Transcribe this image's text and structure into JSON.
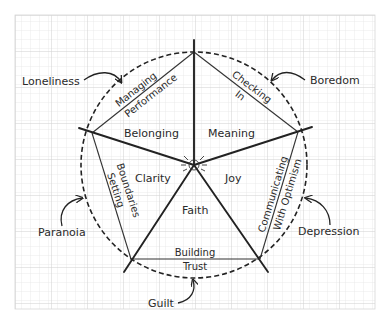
{
  "diagram": {
    "title": "",
    "colors": {
      "background": "#ffffff",
      "grid_minor": "#e4e4e4",
      "grid_major": "#cfcfcf",
      "ink": "#222222"
    },
    "center_labels": {
      "belonging": "Belonging",
      "meaning": "Meaning",
      "clarity": "Clarity",
      "joy": "Joy",
      "faith": "Faith"
    },
    "edge_labels": {
      "managing_performance": [
        "Managing",
        "Performance"
      ],
      "checking_in": [
        "Checking",
        "In"
      ],
      "setting_boundaries": [
        "Setting",
        "Boundaries"
      ],
      "communicating_with_optimism": [
        "Communicating",
        "With Optimism"
      ],
      "building_trust": [
        "Building",
        "Trust"
      ]
    },
    "outer_feelings": {
      "loneliness": "Loneliness",
      "boredom": "Boredom",
      "paranoia": "Paranoia",
      "depression": "Depression",
      "guilt": "Guilt"
    }
  }
}
